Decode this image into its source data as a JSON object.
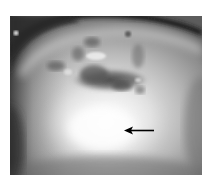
{
  "figure": {
    "type": "grayscale-photograph",
    "annotation": {
      "kind": "arrow",
      "direction": "left",
      "color": "#000000",
      "target": "bright white region below dark patches"
    },
    "colors": {
      "background": "#ffffff",
      "dark_rim": "#1e1e1e",
      "bright_center": "#f4f4f4",
      "dark_patch": "#4a4a4a",
      "periphery": "#7a7a7a"
    }
  }
}
